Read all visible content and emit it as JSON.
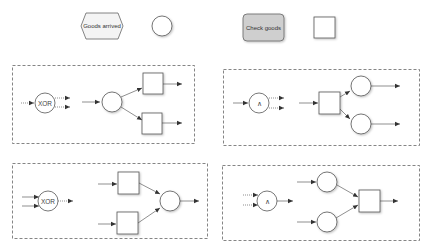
{
  "legend": {
    "event_label": "Goods arrived",
    "function_label": "Check goods"
  },
  "colors": {
    "stroke": "#555555",
    "event_fill": "#f4f4f4",
    "function_fill": "#cfcfcf",
    "dash": "#666666",
    "background": "#ffffff"
  },
  "panels": [
    {
      "id": "xor-split",
      "gate_label": "XOR",
      "pattern": "event-to-functions-split"
    },
    {
      "id": "and-split",
      "gate_label": "∧",
      "pattern": "function-to-events-split"
    },
    {
      "id": "xor-join",
      "gate_label": "XOR",
      "pattern": "functions-to-event-join"
    },
    {
      "id": "and-join",
      "gate_label": "∧",
      "pattern": "events-to-function-join"
    }
  ]
}
